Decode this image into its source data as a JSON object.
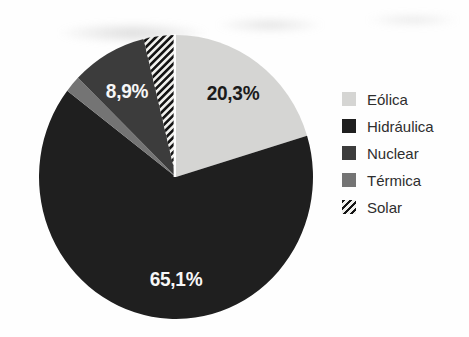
{
  "figure": {
    "kind": "scanned-textbook-pie-figure",
    "background_color": "#fefefe"
  },
  "chart_data": {
    "type": "pie",
    "title": "",
    "start_angle_deg": 0,
    "direction": "clockwise",
    "slices": [
      {
        "name": "Eólica",
        "value": 20.3,
        "label": "20,3%",
        "color": "#d5d5d3",
        "label_color": "#1b1b1b"
      },
      {
        "name": "Hidráulica",
        "value": 65.1,
        "label": "65,1%",
        "color": "#1f1f1f",
        "label_color": "#f7f7f7"
      },
      {
        "name": "Térmica",
        "value": 1.9,
        "label": "",
        "color": "#747474",
        "label_color": ""
      },
      {
        "name": "Nuclear",
        "value": 8.9,
        "label": "8,9%",
        "color": "#3c3c3c",
        "label_color": "#f7f7f7"
      },
      {
        "name": "Solar",
        "value": 3.8,
        "label": "",
        "color": "#efefec",
        "pattern": "diagonal-hatch",
        "stripe_color": "#141414"
      }
    ],
    "legend": {
      "position": "right",
      "items": [
        "Eólica",
        "Hidráulica",
        "Nuclear",
        "Térmica",
        "Solar"
      ]
    }
  }
}
